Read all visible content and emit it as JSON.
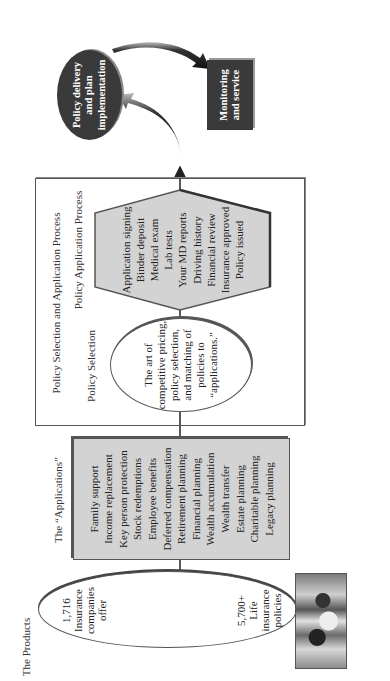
{
  "diagram": {
    "products": {
      "title": "The Products",
      "left_lines": [
        "1,716",
        "Insurance",
        "companies",
        "offer"
      ],
      "right_lines": [
        "5,700+",
        "Life",
        "insurance",
        "policies"
      ]
    },
    "applications": {
      "title": "The “Applications”",
      "items": [
        "Family support",
        "Income replacement",
        "Key person protection",
        "Stock redemptions",
        "Employee benefits",
        "Deferred compensation",
        "Retirement planning",
        "Financial planning",
        "Wealth accumulation",
        "Wealth transfer",
        "Estate planning",
        "Charitable planning",
        "Legacy planning"
      ]
    },
    "process_frame": {
      "title": "Policy Selection and Application Process",
      "selection": {
        "title": "Policy Selection",
        "lines": [
          "The art of",
          "competitive pricing,",
          "policy selection,",
          "and matching of",
          "policies to",
          "“applications.”"
        ]
      },
      "application": {
        "title": "Policy Application Process",
        "items": [
          "Application signing",
          "Binder deposit",
          "Medical exam",
          "Lab tests",
          "Your MD reports",
          "Driving history",
          "Financial review",
          "Insurance approved",
          "Policy issued"
        ]
      }
    },
    "delivery": {
      "lines": [
        "Policy delivery",
        "and plan",
        "implementation"
      ]
    },
    "monitoring": {
      "lines": [
        "Monitoring",
        "and service"
      ]
    },
    "colors": {
      "box_fill": "#d3d3d3",
      "dark_fill": "#3a3a3a",
      "line": "#555555"
    }
  }
}
